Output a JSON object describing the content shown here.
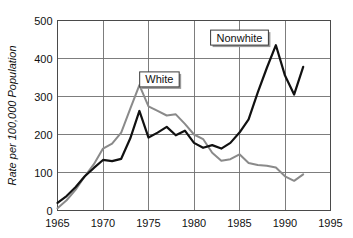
{
  "chart_data": {
    "type": "line",
    "title": "",
    "subtitle": "",
    "xlabel": "",
    "ylabel": "Rate per 100,000 Population",
    "xlim": [
      1965,
      1995
    ],
    "ylim": [
      0,
      500
    ],
    "xticks": [
      1965,
      1970,
      1975,
      1980,
      1985,
      1990,
      1995
    ],
    "yticks": [
      0,
      100,
      200,
      300,
      400,
      500
    ],
    "grid": true,
    "legend_position": "inline-annotations",
    "x": [
      1965,
      1966,
      1967,
      1968,
      1969,
      1970,
      1971,
      1972,
      1973,
      1974,
      1975,
      1976,
      1977,
      1978,
      1979,
      1980,
      1981,
      1982,
      1983,
      1984,
      1985,
      1986,
      1987,
      1988,
      1989,
      1990,
      1991,
      1992
    ],
    "series": [
      {
        "name": "Nonwhite",
        "color": "#111111",
        "values": [
          20,
          38,
          62,
          90,
          112,
          133,
          130,
          136,
          190,
          262,
          192,
          205,
          220,
          198,
          210,
          178,
          165,
          172,
          163,
          178,
          205,
          240,
          310,
          375,
          435,
          355,
          305,
          378
        ]
      },
      {
        "name": "White",
        "color": "#8a8a8a",
        "values": [
          6,
          27,
          55,
          90,
          122,
          163,
          176,
          205,
          268,
          330,
          274,
          262,
          250,
          253,
          228,
          200,
          188,
          152,
          131,
          135,
          148,
          125,
          120,
          118,
          113,
          90,
          78,
          95
        ]
      }
    ],
    "annotations": [
      {
        "label": "Nonwhite",
        "x": 1985.0,
        "y": 455
      },
      {
        "label": "White",
        "x": 1976.2,
        "y": 345
      }
    ]
  },
  "axis": {
    "y_label": "Rate per 100,000 Population",
    "y_tick_labels": [
      "0",
      "100",
      "200",
      "300",
      "400",
      "500"
    ],
    "x_tick_labels": [
      "1965",
      "1970",
      "1975",
      "1980",
      "1985",
      "1990",
      "1995"
    ]
  },
  "legend": {
    "nonwhite_label": "Nonwhite",
    "white_label": "White"
  },
  "colors": {
    "nonwhite_line": "#111111",
    "white_line": "#8a8a8a",
    "grid": "#6f6f6f",
    "frame": "#4a4a4a",
    "background": "#ffffff"
  }
}
